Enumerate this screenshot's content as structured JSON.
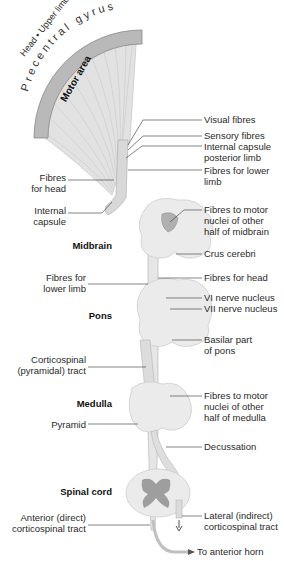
{
  "cortex": {
    "title": "Precentral gyrus",
    "band": "Head • Upper limb • Trunk • Lower limb",
    "area": "Motor area"
  },
  "labels_right": [
    {
      "id": "visual-fibres",
      "text": "Visual fibres"
    },
    {
      "id": "sensory-fibres",
      "text": "Sensory fibres"
    },
    {
      "id": "internal-capsule-posterior-limb",
      "text": "Internal capsule\nposterior limb"
    },
    {
      "id": "fibres-lower-limb-top",
      "text": "Fibres for lower\nlimb"
    },
    {
      "id": "fibres-motor-midbrain",
      "text": "Fibres to motor\nnuclei of other\nhalf of midbrain"
    },
    {
      "id": "crus-cerebri",
      "text": "Crus cerebri"
    },
    {
      "id": "fibres-head-right",
      "text": "Fibres for head"
    },
    {
      "id": "vi-nerve-nucleus",
      "text": "VI nerve nucleus"
    },
    {
      "id": "vii-nerve-nucleus",
      "text": "VII nerve nucleus"
    },
    {
      "id": "basilar-part-pons",
      "text": "Basilar part\nof pons"
    },
    {
      "id": "fibres-motor-medulla",
      "text": "Fibres to motor\nnuclei of other\nhalf of medulla"
    },
    {
      "id": "decussation",
      "text": "Decussation"
    },
    {
      "id": "lateral-corticospinal",
      "text": "Lateral (indirect)\ncorticospinal tract"
    },
    {
      "id": "anterior-horn",
      "text": "To anterior horn"
    }
  ],
  "labels_left": [
    {
      "id": "fibres-head-left",
      "text": "Fibres\nfor head"
    },
    {
      "id": "internal-capsule",
      "text": "Internal\ncapsule"
    },
    {
      "id": "fibres-lower-limb-left",
      "text": "Fibres for\nlower limb"
    },
    {
      "id": "corticospinal-tract",
      "text": "Corticospinal\n(pyramidal) tract"
    },
    {
      "id": "pyramid",
      "text": "Pyramid"
    },
    {
      "id": "anterior-corticospinal",
      "text": "Anterior (direct)\ncorticospinal tract"
    }
  ],
  "regions": {
    "midbrain": "Midbrain",
    "pons": "Pons",
    "medulla": "Medulla",
    "spinal_cord": "Spinal cord"
  },
  "colors": {
    "band": "#b9b9b9",
    "structure": "#ebebeb",
    "structure_edge": "#c8c8c8",
    "fibres": "#a8a8a8",
    "grey_matter": "#9a9a9a",
    "line": "#333333"
  }
}
